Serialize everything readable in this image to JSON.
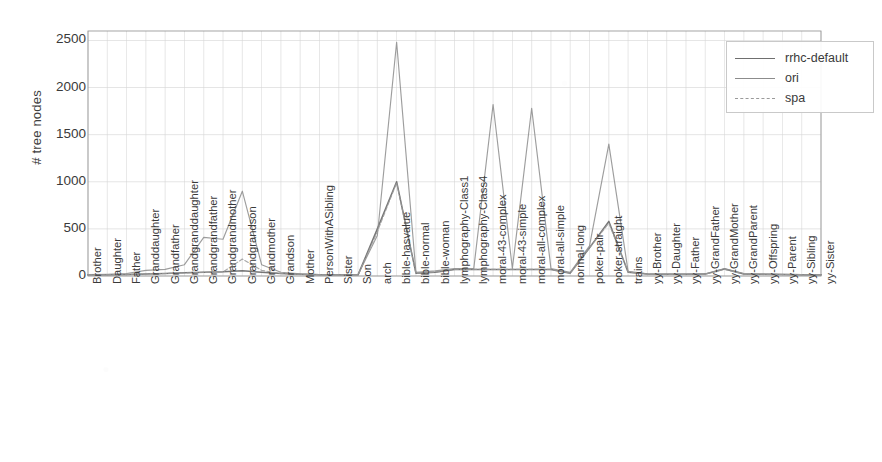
{
  "chart_data": {
    "type": "line",
    "title": "",
    "xlabel": "",
    "ylabel": "# tree nodes",
    "ylim": [
      0,
      2600
    ],
    "yticks": [
      0,
      500,
      1000,
      1500,
      2000,
      2500
    ],
    "ytick_labels": [
      "0",
      "500",
      "1000",
      "1500",
      "2000",
      "2500"
    ],
    "grid": true,
    "legend_position": "upper right",
    "categories": [
      "Brother",
      "Daughter",
      "Father",
      "Granddaughter",
      "Grandfather",
      "Grandgranddaughter",
      "Grandgrandfather",
      "Grandgrandmother",
      "Grandgrandson",
      "Grandmother",
      "Grandson",
      "Mother",
      "PersonWithASibling",
      "Sister",
      "Son",
      "arch",
      "bible-hasvalue",
      "bible-normal",
      "bible-woman",
      "lymphography-Class1",
      "lymphography-Class4",
      "moral-43-complex",
      "moral-43-simple",
      "moral-all-complex",
      "moral-all-simple",
      "normal-long",
      "poker-pair",
      "poker-straight",
      "trains",
      "yy-Brother",
      "yy-Daughter",
      "yy-Father",
      "yy-GrandFather",
      "yy-GrandMother",
      "yy-GrandParent",
      "yy-Offspring",
      "yy-Parent",
      "yy-Sibling",
      "yy-Sister"
    ],
    "series": [
      {
        "name": "rrhc-default",
        "color": "#6f6f6f",
        "dash": "none",
        "values": [
          12,
          14,
          16,
          22,
          26,
          34,
          40,
          44,
          55,
          40,
          26,
          18,
          14,
          12,
          12,
          500,
          1000,
          30,
          40,
          70,
          70,
          70,
          70,
          70,
          70,
          30,
          300,
          580,
          40,
          20,
          18,
          18,
          20,
          75,
          22,
          18,
          16,
          14,
          12
        ]
      },
      {
        "name": "ori",
        "color": "#8c8c8c",
        "dash": "none",
        "values": [
          14,
          18,
          26,
          60,
          70,
          120,
          410,
          390,
          900,
          120,
          40,
          22,
          16,
          14,
          14,
          430,
          2480,
          40,
          55,
          80,
          80,
          1820,
          80,
          1780,
          80,
          40,
          320,
          1400,
          50,
          22,
          20,
          20,
          24,
          80,
          26,
          20,
          18,
          16,
          14
        ]
      },
      {
        "name": "spa",
        "color": "#9a9a9a",
        "dash": "dashed",
        "values": [
          12,
          14,
          16,
          22,
          26,
          32,
          38,
          42,
          180,
          60,
          26,
          18,
          14,
          12,
          12,
          470,
          990,
          30,
          42,
          70,
          70,
          70,
          70,
          70,
          70,
          30,
          300,
          560,
          42,
          20,
          18,
          18,
          20,
          70,
          22,
          18,
          16,
          14,
          12
        ]
      }
    ]
  },
  "legend": {
    "entries": [
      {
        "label": "rrhc-default"
      },
      {
        "label": "ori"
      },
      {
        "label": "spa"
      }
    ]
  },
  "colors": {
    "axis": "#8a8a8a",
    "grid": "#d6d6d6",
    "text": "#3a3a3a",
    "background": "#ffffff"
  }
}
